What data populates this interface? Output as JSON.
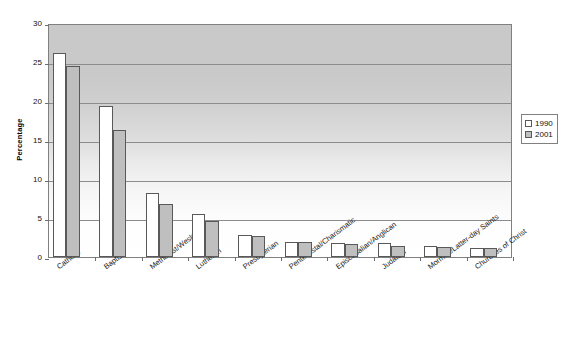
{
  "chart_data": {
    "type": "bar",
    "title": "",
    "xlabel": "",
    "ylabel": "Percentage",
    "ylim": [
      0,
      30
    ],
    "yticks": [
      0,
      5,
      10,
      15,
      20,
      25,
      30
    ],
    "grid": true,
    "legend_position": "right",
    "categories": [
      "Catholic",
      "Baptist",
      "Methodist/Wesleyan",
      "Lutheran",
      "Presbyterian",
      "Pentecostal/Charismatic",
      "Episcopalian/Anglican",
      "Judaism",
      "Mormon/Latter-day Saints",
      "Churches of Christ"
    ],
    "series": [
      {
        "name": "1990",
        "color": "#ffffff",
        "values": [
          26.2,
          19.4,
          8.2,
          5.5,
          2.8,
          1.9,
          1.8,
          1.8,
          1.4,
          1.2
        ]
      },
      {
        "name": "2001",
        "color": "#bfbfbf",
        "values": [
          24.5,
          16.3,
          6.8,
          4.6,
          2.7,
          1.9,
          1.7,
          1.4,
          1.3,
          1.2
        ]
      }
    ]
  },
  "legend": {
    "items": [
      {
        "label": "1990"
      },
      {
        "label": "2001"
      }
    ]
  }
}
